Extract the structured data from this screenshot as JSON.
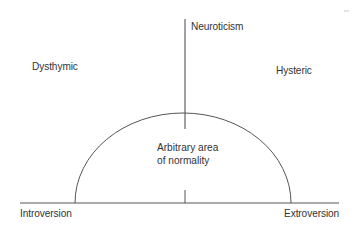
{
  "diagram": {
    "axes": {
      "vertical": {
        "label": "Neuroticism"
      },
      "horizontal": {
        "left_label": "Introversion",
        "right_label": "Extroversion"
      }
    },
    "quadrants": {
      "upper_left": "Dysthymic",
      "upper_right": "Hysteric"
    },
    "region": {
      "line1": "Arbitrary area",
      "line2": "of normality"
    },
    "colors": {
      "line": "#444444",
      "text": "#333333",
      "background": "#ffffff"
    }
  }
}
